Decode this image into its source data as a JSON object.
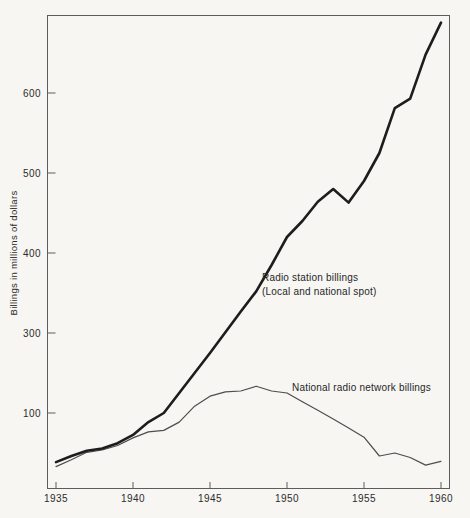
{
  "page": {
    "background_color": "#f7f6f3",
    "frame_color": "#5c5c5c"
  },
  "chart": {
    "annotations": {
      "station": {
        "line1": "Radio station billings",
        "line2": "(Local and national spot)"
      },
      "network": {
        "text": "National radio network billings"
      }
    },
    "colors": {
      "station_line": "#1d1d1d",
      "network_line": "#4d4d4d",
      "axis": "#5c5c5c",
      "text": "#2b2b2b"
    }
  },
  "chart_data": {
    "type": "line",
    "title": "",
    "xlabel": "",
    "ylabel": "Billings in millions of dollars",
    "grid": false,
    "legend_position": "none",
    "x_ticks": [
      1935,
      1940,
      1945,
      1950,
      1955,
      1960
    ],
    "y_ticks": [
      100,
      300,
      400,
      500,
      600
    ],
    "y_axis_note": "irregular scale: equal pixel spacing between the 100 and 300 ticks as between 100-unit intervals above 300",
    "xlim": [
      1935,
      1960
    ],
    "ylim": [
      0,
      700
    ],
    "x": [
      1935,
      1936,
      1937,
      1938,
      1939,
      1940,
      1941,
      1942,
      1943,
      1944,
      1945,
      1946,
      1947,
      1948,
      1949,
      1950,
      1951,
      1952,
      1953,
      1954,
      1955,
      1956,
      1957,
      1958,
      1959,
      1960
    ],
    "series": [
      {
        "name": "Radio station billings (Local and national spot)",
        "style": "thick",
        "values": [
          35,
          43,
          50,
          53,
          60,
          71,
          88,
          100,
          150,
          200,
          250,
          301,
          327,
          352,
          385,
          420,
          440,
          464,
          480,
          463,
          490,
          525,
          581,
          593,
          648,
          688
        ]
      },
      {
        "name": "National radio network billings",
        "style": "thin",
        "values": [
          29,
          38,
          48,
          51,
          57,
          67,
          75,
          77,
          88,
          117,
          142,
          153,
          155,
          167,
          155,
          150,
          128,
          107,
          92,
          80,
          68,
          43,
          47,
          41,
          31,
          36
        ]
      }
    ]
  }
}
